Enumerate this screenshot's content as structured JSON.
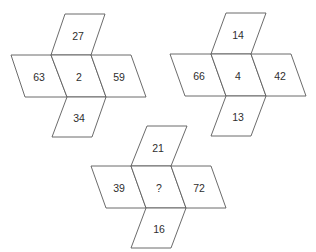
{
  "puzzle": {
    "figures": [
      {
        "top": "27",
        "left": "63",
        "center": "2",
        "right": "59",
        "bottom": "34"
      },
      {
        "top": "14",
        "left": "66",
        "center": "4",
        "right": "42",
        "bottom": "13"
      },
      {
        "top": "21",
        "left": "39",
        "center": "?",
        "right": "72",
        "bottom": "16"
      }
    ]
  }
}
